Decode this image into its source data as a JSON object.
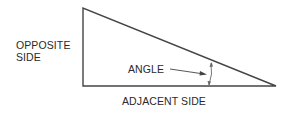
{
  "diagram": {
    "labels": {
      "opposite_line1": "OPPOSITE",
      "opposite_line2": "SIDE",
      "angle": "ANGLE",
      "adjacent": "ADJACENT SIDE"
    },
    "colors": {
      "line": "#444444",
      "text": "#2a2a2a"
    }
  }
}
